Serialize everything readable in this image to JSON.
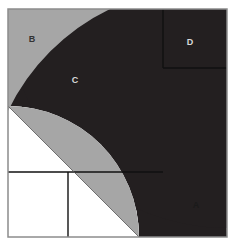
{
  "figure": {
    "type": "geometric-diagram",
    "canvas": {
      "width": 236,
      "height": 249
    },
    "frame": {
      "x": 8,
      "y": 9,
      "width": 219,
      "height": 228,
      "border_color": "#8c8c8c",
      "border_width": 1.5
    },
    "palette": {
      "dark": "#231f20",
      "gray": "#a6a6a6",
      "white": "#ffffff",
      "line": "#111111",
      "frame_border": "#8c8c8c",
      "label_on_dark": "#d9d9d9",
      "label_on_gray": "#333333",
      "label_on_white": "#1a1a1a"
    },
    "geometry": {
      "arc_center_x": 8,
      "arc_center_y": 237,
      "outer_radius": 219,
      "inner_radius": 131,
      "lens_note": "central vesica split along the diagonal from upper-right to lower-left",
      "divider_vertical_x": 163,
      "divider_horizontal_y": 68,
      "lower_divider_horizontal_y": 172,
      "lower_divider_vertical_x": 68
    },
    "regions": [
      {
        "id": "A",
        "label": "A",
        "fill": "#ffffff",
        "label_color": "#1a1a1a",
        "label_x": 196,
        "label_y": 206,
        "description": "white region outside the annulus at bottom right"
      },
      {
        "id": "B",
        "label": "B",
        "fill": "#a6a6a6",
        "label_color": "#333333",
        "label_x": 32,
        "label_y": 40,
        "description": "gray region outside the annulus at top left"
      },
      {
        "id": "C",
        "label": "C",
        "fill": "#231f20",
        "label_color": "#d9d9d9",
        "label_x": 75,
        "label_y": 81,
        "description": "dark annulus band"
      },
      {
        "id": "D",
        "label": "D",
        "fill": "#231f20",
        "label_color": "#d9d9d9",
        "label_x": 190,
        "label_y": 43,
        "description": "dark square in the upper right corner"
      }
    ]
  }
}
